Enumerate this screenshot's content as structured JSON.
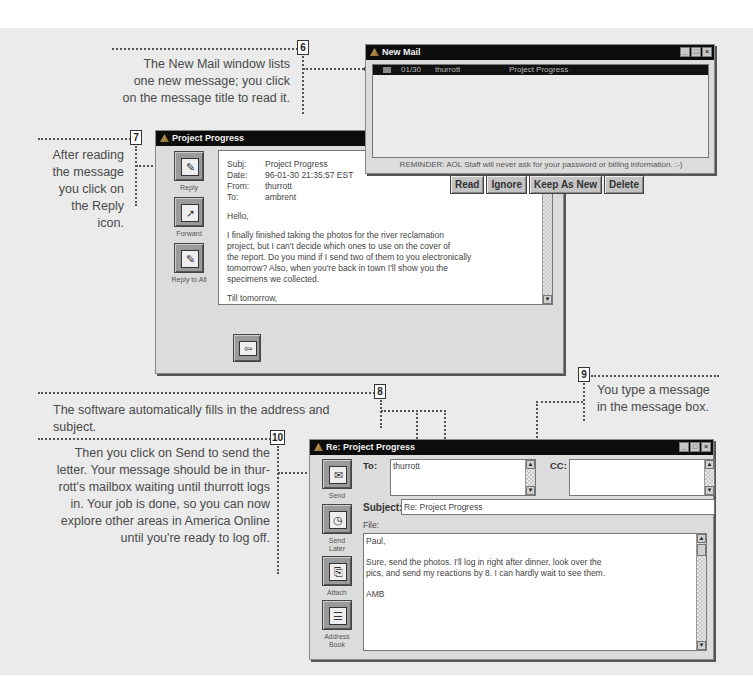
{
  "callouts": {
    "c6": {
      "number": "6",
      "text_lines": [
        "The New Mail window lists",
        "one new message; you click",
        "on the message title to read it."
      ]
    },
    "c7": {
      "number": "7",
      "text_lines": [
        "After reading",
        "the message",
        "you click on",
        "the Reply",
        "icon."
      ]
    },
    "c8": {
      "number": "8",
      "text": "The software automatically fills in the address and subject."
    },
    "c9": {
      "number": "9",
      "text_lines": [
        "You type a message",
        "in the message box."
      ]
    },
    "c10": {
      "number": "10",
      "text_lines": [
        "Then you click on Send to send the",
        "letter. Your message should be in thur-",
        "rott's mailbox waiting until thurrott logs",
        "in. Your job is done, so you can now",
        "explore other areas in America Online",
        "until you're ready to log off."
      ]
    }
  },
  "new_mail": {
    "title": "New Mail",
    "messages": [
      {
        "date": "01/30",
        "sender": "thurrott",
        "subject": "Project Progress",
        "selected": true
      }
    ],
    "reminder": "REMINDER: AOL Staff will never ask for your password or billing information. :-)",
    "buttons": {
      "read": "Read",
      "ignore": "Ignore",
      "keep_as_new": "Keep As New",
      "delete": "Delete"
    }
  },
  "read_window": {
    "title": "Project Progress",
    "side_buttons": {
      "reply": "Reply",
      "forward": "Forward",
      "reply_all": "Reply to All"
    },
    "header": {
      "subj_label": "Subj:",
      "subj": "Project Progress",
      "date_label": "Date:",
      "date": "96-01-30 21:35:57 EST",
      "from_label": "From:",
      "from": "thurrott",
      "to_label": "To:",
      "to": "ambrent"
    },
    "body": {
      "greeting": "Hello,",
      "paragraph_lines": [
        "I finally finished taking the photos for the river reclamation",
        "project, but I can't decide which ones to use on the cover of",
        "the report. Do you mind if I send two of them to you electronically",
        "tomorrow? Also, when you're back in town I'll show you the",
        "specimens we collected."
      ],
      "closing": "Till tomorrow,",
      "signature": "PBT"
    },
    "next_button": "Next"
  },
  "compose_window": {
    "title": "Re: Project Progress",
    "to_label": "To:",
    "to_value": "thurrott",
    "cc_label": "CC:",
    "cc_value": "",
    "subject_label": "Subject:",
    "subject_value": "Re: Project Progress",
    "file_label": "File:",
    "side_buttons": {
      "send": "Send",
      "send_later_1": "Send",
      "send_later_2": "Later",
      "attach": "Attach",
      "address_book_1": "Address",
      "address_book_2": "Book"
    },
    "body": {
      "greeting": "Paul,",
      "lines": [
        "Sure, send the photos. I'll log in right after dinner, look over the",
        "pics, and send my reactions by 8. I can hardly wait to see them."
      ],
      "signature": "AMB"
    }
  }
}
